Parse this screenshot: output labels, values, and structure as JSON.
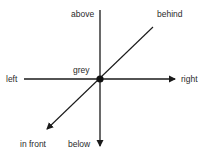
{
  "diagram": {
    "center_label": "grey",
    "labels": {
      "above": "above",
      "below": "below",
      "left": "left",
      "right": "right",
      "behind": "behind",
      "in_front": "in front"
    },
    "colors": {
      "line": "#1a1a1a",
      "text": "#2a2a2a",
      "background": "#ffffff"
    }
  }
}
